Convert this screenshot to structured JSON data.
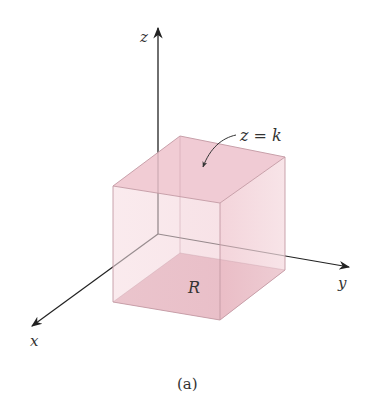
{
  "figure": {
    "caption": "(a)",
    "axes": {
      "x_label": "x",
      "y_label": "y",
      "z_label": "z"
    },
    "annotations": {
      "top_face_label": "z = k",
      "base_region_label": "R"
    },
    "colors": {
      "base_region": "#d89aa8",
      "top_face": "#efc7d0",
      "side_face_right": "#f4d6dc",
      "side_face_front": "#f8e4e8",
      "axis": "#333333",
      "edge": "#b98a95"
    }
  }
}
